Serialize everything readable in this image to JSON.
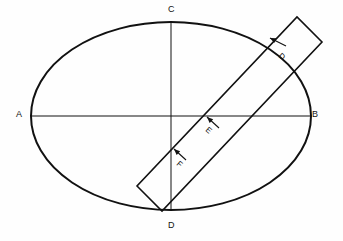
{
  "figure": {
    "title": "",
    "type": "geometric-diagram",
    "background_color": "#fefefe",
    "stroke_color": "#111111"
  },
  "ellipse": {
    "name": "ellipse-outline",
    "center_x": 171,
    "center_y": 116,
    "radius_x": 140,
    "radius_y": 94,
    "stroke_width": 2.0
  },
  "axes": {
    "horizontal": {
      "name": "axis-AB",
      "x1": 31,
      "y1": 116,
      "x2": 311,
      "y2": 116,
      "stroke_width": 1.0
    },
    "vertical": {
      "name": "axis-CD",
      "x1": 171,
      "y1": 22,
      "x2": 171,
      "y2": 210,
      "stroke_width": 1.0
    }
  },
  "strip": {
    "name": "rotated-rectangle",
    "angle_deg": -49,
    "width": 34,
    "corner_1_x": 137,
    "corner_1_y": 186,
    "corner_2_x": 162,
    "corner_2_y": 211,
    "corner_3_x": 322,
    "corner_3_y": 42,
    "corner_4_x": 297,
    "corner_4_y": 17,
    "stroke_width": 1.6
  },
  "labels": {
    "a": "A",
    "b": "B",
    "c": "C",
    "d_bottom": "D",
    "d_strip": "D",
    "e": "E",
    "f": "F"
  },
  "arrows": [
    {
      "name": "arrow-to-D",
      "label": "D",
      "from_x": 286,
      "from_y": 46,
      "to_x": 270,
      "to_y": 38
    },
    {
      "name": "arrow-to-E",
      "label": "E",
      "from_x": 219,
      "from_y": 128,
      "to_x": 207,
      "to_y": 117
    },
    {
      "name": "arrow-to-F",
      "label": "F",
      "from_x": 186,
      "from_y": 160,
      "to_x": 174,
      "to_y": 149
    }
  ]
}
